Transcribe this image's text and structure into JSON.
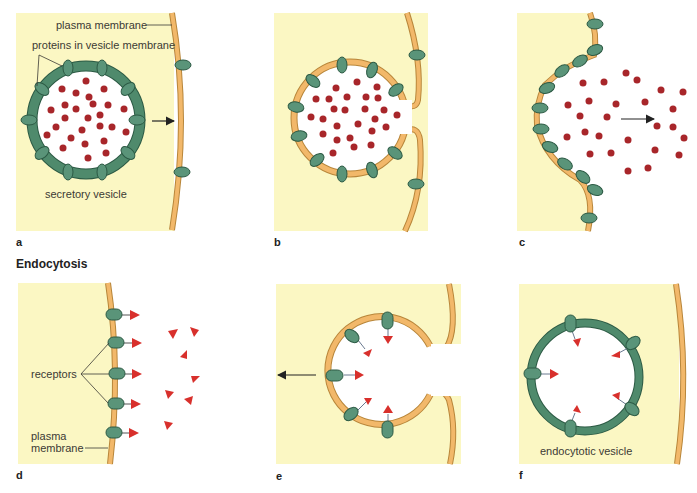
{
  "colors": {
    "cytoplasm": "#fbf7c3",
    "membrane": "#f2b86a",
    "membrane_stroke": "#b8863a",
    "vesicle_green": "#4f8a6c",
    "protein": "#5a9479",
    "protein_stroke": "#2c5a44",
    "cargo": "#a8262a",
    "ligand": "#d8302c",
    "text": "#3b3a35"
  },
  "section": {
    "endocytosis_title": "Endocytosis"
  },
  "panels": {
    "a": {
      "letter": "a",
      "label_plasma_membrane": "plasma membrane",
      "label_proteins": "proteins in vesicle membrane",
      "label_vesicle": "secretory vesicle"
    },
    "b": {
      "letter": "b"
    },
    "c": {
      "letter": "c"
    },
    "d": {
      "letter": "d",
      "label_receptors": "receptors",
      "label_plasma_line1": "plasma",
      "label_plasma_line2": "membrane"
    },
    "e": {
      "letter": "e"
    },
    "f": {
      "letter": "f",
      "label_vesicle": "endocytotic vesicle"
    }
  }
}
